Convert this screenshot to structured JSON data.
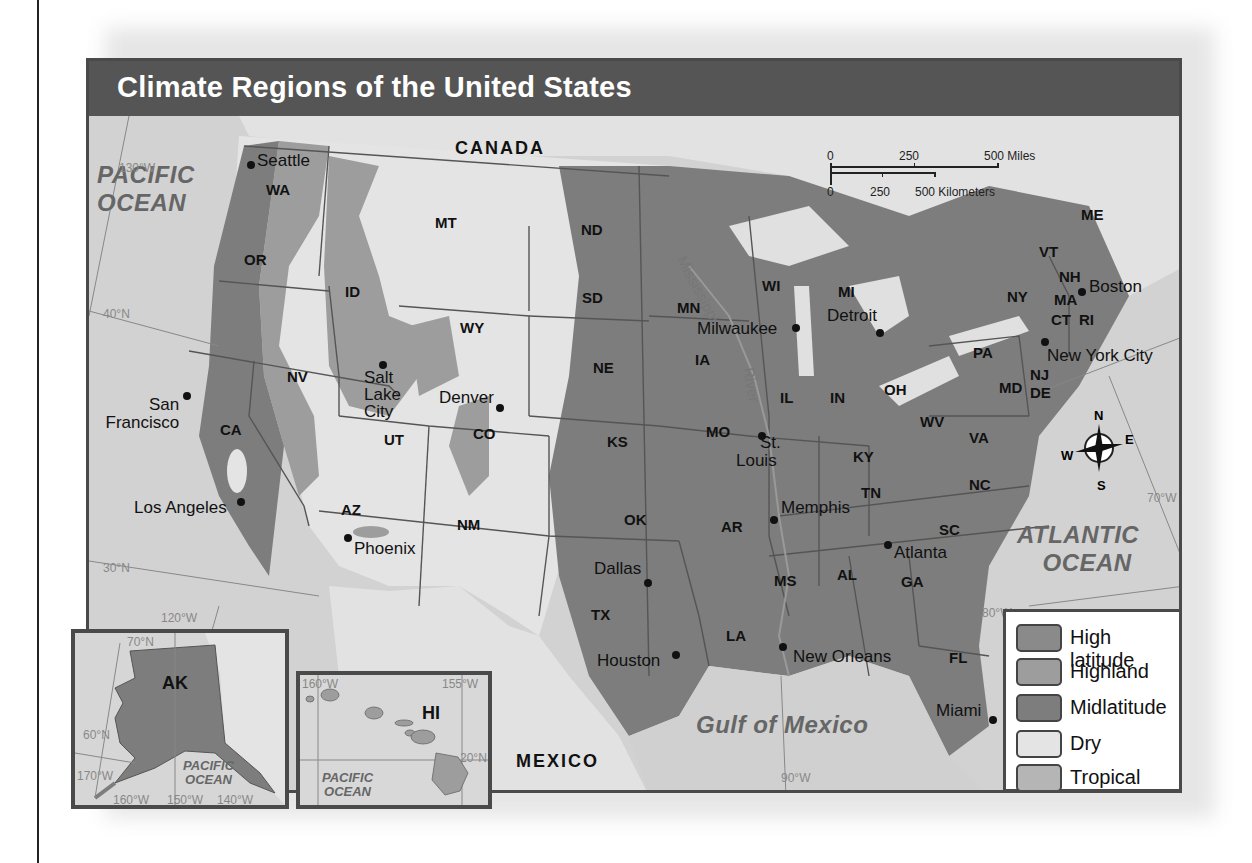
{
  "title": "Climate Regions of the United States",
  "countries": {
    "canada": "CANADA",
    "mexico": "MEXICO"
  },
  "oceans": {
    "pacific_main": [
      "PACIFIC",
      "OCEAN"
    ],
    "atlantic": [
      "ATLANTIC",
      "OCEAN"
    ],
    "gulf": "Gulf of Mexico",
    "pacific_ak": [
      "PACIFIC",
      "OCEAN"
    ],
    "pacific_hi": [
      "PACIFIC",
      "OCEAN"
    ]
  },
  "river": {
    "name_top": "Mississippi",
    "name_bottom": "River"
  },
  "scale_bar": {
    "miles": [
      "0",
      "250",
      "500 Miles"
    ],
    "kilometers": [
      "0",
      "250",
      "500 Kilometers"
    ]
  },
  "compass": {
    "n": "N",
    "e": "E",
    "s": "S",
    "w": "W"
  },
  "coordinates": {
    "lon_130w": "130°W",
    "lat_40n": "40°N",
    "lat_30n": "30°N",
    "lon_120w": "120°W",
    "lon_90w": "90°W",
    "lon_80w": "80°W",
    "lon_70w": "70°W",
    "ak": {
      "lat_70n": "70°N",
      "lat_60n": "60°N",
      "lon_170w": "170°W",
      "lon_160w": "160°W",
      "lon_150w": "150°W",
      "lon_140w": "140°W"
    },
    "hi": {
      "lon_160w": "160°W",
      "lon_155w": "155°W",
      "lat_20n": "20°N"
    }
  },
  "states": [
    "WA",
    "OR",
    "CA",
    "NV",
    "ID",
    "MT",
    "WY",
    "UT",
    "CO",
    "AZ",
    "NM",
    "ND",
    "SD",
    "NE",
    "KS",
    "OK",
    "TX",
    "MN",
    "IA",
    "MO",
    "AR",
    "LA",
    "WI",
    "IL",
    "MI",
    "IN",
    "OH",
    "KY",
    "TN",
    "MS",
    "AL",
    "GA",
    "FL",
    "SC",
    "NC",
    "VA",
    "WV",
    "PA",
    "NY",
    "VT",
    "NH",
    "ME",
    "MA",
    "CT",
    "RI",
    "NJ",
    "DE",
    "MD",
    "AK",
    "HI"
  ],
  "cities": {
    "seattle": "Seattle",
    "san_francisco": [
      "San",
      "Francisco"
    ],
    "los_angeles": "Los Angeles",
    "salt_lake_city": [
      "Salt",
      "Lake",
      "City"
    ],
    "denver": "Denver",
    "phoenix": "Phoenix",
    "dallas": "Dallas",
    "houston": "Houston",
    "milwaukee": "Milwaukee",
    "st_louis": [
      "St.",
      "Louis"
    ],
    "memphis": "Memphis",
    "new_orleans": "New Orleans",
    "detroit": "Detroit",
    "atlanta": "Atlanta",
    "miami": "Miami",
    "new_york_city": "New York City",
    "boston": "Boston"
  },
  "legend": [
    {
      "label": "High latitude",
      "color": "#8a8a8a"
    },
    {
      "label": "Highland",
      "color": "#9d9d9d"
    },
    {
      "label": "Midlatitude",
      "color": "#7d7d7d"
    },
    {
      "label": "Dry",
      "color": "#e4e4e4"
    },
    {
      "label": "Tropical",
      "color": "#b5b5b5"
    }
  ]
}
